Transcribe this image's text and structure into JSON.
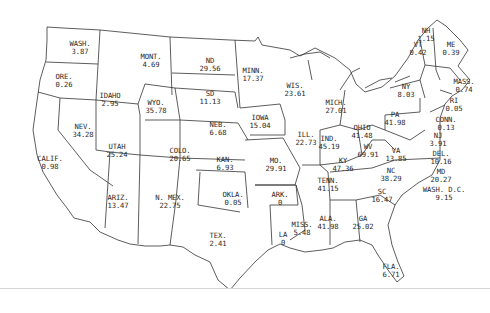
{
  "map": {
    "region": "United States (contiguous) with Washington D.C.",
    "line_color": "#333333",
    "background": "#ffffff",
    "states": [
      {
        "abbr": "WASH.",
        "value": "3.87",
        "x": 80,
        "y": 40
      },
      {
        "abbr": "ORE.",
        "value": "0.26",
        "x": 64,
        "y": 73
      },
      {
        "abbr": "CALIF.",
        "value": "0.98",
        "x": 50,
        "y": 155
      },
      {
        "abbr": "IDAHO",
        "value": "2.95",
        "x": 110,
        "y": 92
      },
      {
        "abbr": "NEV.",
        "value": "34.28",
        "x": 83,
        "y": 123
      },
      {
        "abbr": "MONT.",
        "value": "4.69",
        "x": 151,
        "y": 53
      },
      {
        "abbr": "WYO.",
        "value": "35.78",
        "x": 156,
        "y": 99
      },
      {
        "abbr": "UTAH",
        "value": "25.24",
        "x": 117,
        "y": 143
      },
      {
        "abbr": "ARIZ.",
        "value": "13.47",
        "x": 118,
        "y": 194
      },
      {
        "abbr": "COLO.",
        "value": "20.65",
        "x": 180,
        "y": 147
      },
      {
        "abbr": "N. MEX.",
        "value": "22.75",
        "x": 170,
        "y": 194
      },
      {
        "abbr": "ND",
        "value": "29.56",
        "x": 210,
        "y": 57
      },
      {
        "abbr": "SD",
        "value": "11.13",
        "x": 210,
        "y": 90
      },
      {
        "abbr": "NEB.",
        "value": "6.68",
        "x": 218,
        "y": 121
      },
      {
        "abbr": "KAN.",
        "value": "6.93",
        "x": 225,
        "y": 156
      },
      {
        "abbr": "OKLA.",
        "value": "0.05",
        "x": 233,
        "y": 191
      },
      {
        "abbr": "TEX.",
        "value": "2.41",
        "x": 218,
        "y": 232
      },
      {
        "abbr": "MINN.",
        "value": "17.37",
        "x": 253,
        "y": 67
      },
      {
        "abbr": "IOWA",
        "value": "15.04",
        "x": 260,
        "y": 114
      },
      {
        "abbr": "MO.",
        "value": "29.91",
        "x": 276,
        "y": 157
      },
      {
        "abbr": "ARK.",
        "value": "0",
        "x": 280,
        "y": 191
      },
      {
        "abbr": "LA",
        "value": "0",
        "x": 283,
        "y": 231
      },
      {
        "abbr": "WIS.",
        "value": "23.61",
        "x": 295,
        "y": 82
      },
      {
        "abbr": "ILL.",
        "value": "22.73",
        "x": 306,
        "y": 131
      },
      {
        "abbr": "MISS.",
        "value": "5.48",
        "x": 302,
        "y": 221
      },
      {
        "abbr": "MICH.",
        "value": "27.01",
        "x": 336,
        "y": 99
      },
      {
        "abbr": "IND.",
        "value": "45.19",
        "x": 329,
        "y": 135
      },
      {
        "abbr": "OHIO",
        "value": "41.48",
        "x": 362,
        "y": 124
      },
      {
        "abbr": "KY",
        "value": "47.36",
        "x": 343,
        "y": 157
      },
      {
        "abbr": "TENN.",
        "value": "41.15",
        "x": 328,
        "y": 177
      },
      {
        "abbr": "ALA.",
        "value": "41.98",
        "x": 328,
        "y": 215
      },
      {
        "abbr": "GA",
        "value": "25.02",
        "x": 363,
        "y": 215
      },
      {
        "abbr": "FLA.",
        "value": "6.71",
        "x": 391,
        "y": 263
      },
      {
        "abbr": "SC",
        "value": "16.47",
        "x": 382,
        "y": 188
      },
      {
        "abbr": "NC",
        "value": "38.29",
        "x": 391,
        "y": 167
      },
      {
        "abbr": "WV",
        "value": "69.91",
        "x": 368,
        "y": 143
      },
      {
        "abbr": "VA",
        "value": "13.85",
        "x": 396,
        "y": 147
      },
      {
        "abbr": "PA",
        "value": "41.98",
        "x": 395,
        "y": 111
      },
      {
        "abbr": "NY",
        "value": "8.03",
        "x": 406,
        "y": 83
      },
      {
        "abbr": "VT",
        "value": "0.42",
        "x": 418,
        "y": 41
      },
      {
        "abbr": "NH",
        "value": "1.15",
        "x": 426,
        "y": 27
      },
      {
        "abbr": "ME",
        "value": "0.39",
        "x": 451,
        "y": 41
      },
      {
        "abbr": "MASS.",
        "value": "0.74",
        "x": 464,
        "y": 78
      },
      {
        "abbr": "RI",
        "value": "0.05",
        "x": 454,
        "y": 97
      },
      {
        "abbr": "CONN.",
        "value": "0.13",
        "x": 446,
        "y": 116
      },
      {
        "abbr": "NJ",
        "value": "3.91",
        "x": 438,
        "y": 132
      },
      {
        "abbr": "DEL.",
        "value": "10.16",
        "x": 441,
        "y": 150
      },
      {
        "abbr": "MD",
        "value": "20.27",
        "x": 441,
        "y": 168
      },
      {
        "abbr": "WASH. D.C.",
        "value": "9.15",
        "x": 444,
        "y": 186
      }
    ]
  }
}
